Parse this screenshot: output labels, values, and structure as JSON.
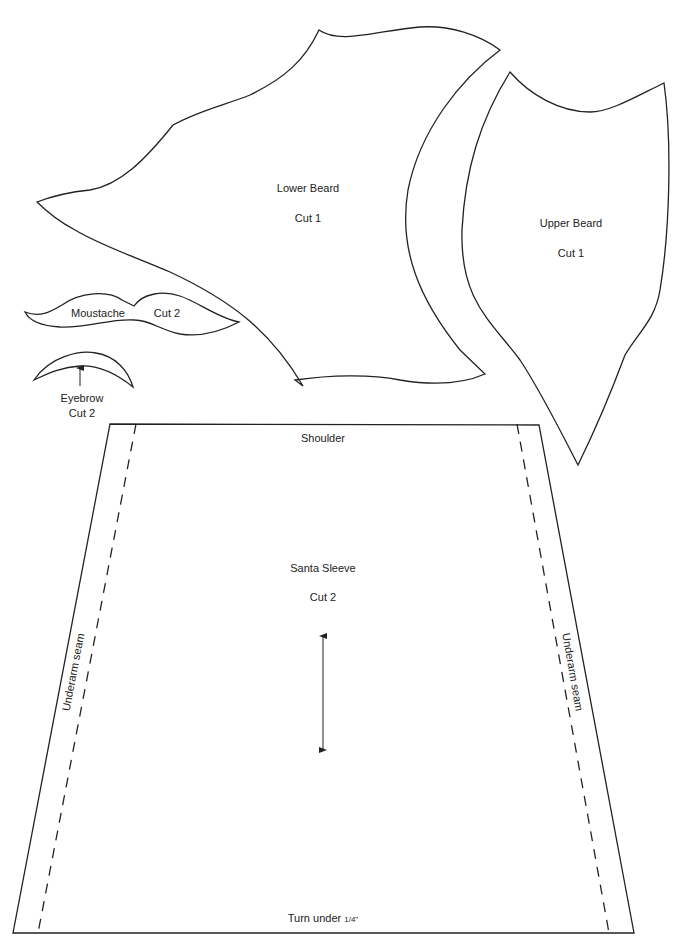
{
  "pieces": {
    "lower_beard": {
      "name": "Lower Beard",
      "cut": "Cut 1"
    },
    "upper_beard": {
      "name": "Upper Beard",
      "cut": "Cut 1"
    },
    "moustache": {
      "name": "Moustache",
      "cut": "Cut 2"
    },
    "eyebrow": {
      "name": "Eyebrow",
      "cut": "Cut 2"
    },
    "sleeve": {
      "name": "Santa Sleeve",
      "cut": "Cut 2",
      "top_label": "Shoulder",
      "bottom_label": "Turn under",
      "bottom_fraction": "1/4\"",
      "left_seam": "Underarm seam",
      "right_seam": "Underarm seam"
    }
  },
  "colors": {
    "line": "#222222",
    "background": "#ffffff"
  }
}
